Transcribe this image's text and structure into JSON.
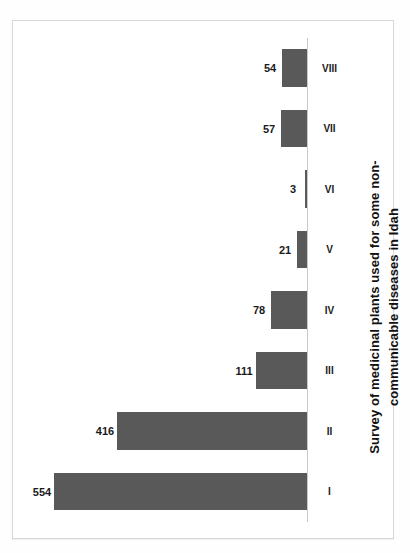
{
  "figure": {
    "frame_border_color": "#d8d8d8",
    "background": "#ffffff",
    "orientation_note": "rotated-90"
  },
  "title": {
    "line1": "Survey of medicinal plants used for some non-",
    "line2": "communicable diseases in Idah",
    "full": "Survey of medicinal plants used for some non-communicable diseases in Idah"
  },
  "chart_data": {
    "type": "bar",
    "xlabel": "",
    "ylabel": "",
    "categories": [
      "I",
      "II",
      "III",
      "IV",
      "V",
      "VI",
      "VII",
      "VIII"
    ],
    "values": [
      554,
      416,
      111,
      78,
      21,
      3,
      57,
      54
    ],
    "value_labels": [
      "554",
      "416",
      "111",
      "78",
      "21",
      "3",
      "57",
      "54"
    ],
    "ylim": [
      0,
      580
    ],
    "grid": false,
    "legend": false,
    "bar_color": "#595959",
    "axis_color": "#c9c9c9",
    "series": [
      {
        "name": "Number of medicinal plants",
        "values": [
          554,
          416,
          111,
          78,
          21,
          3,
          57,
          54
        ]
      }
    ]
  }
}
